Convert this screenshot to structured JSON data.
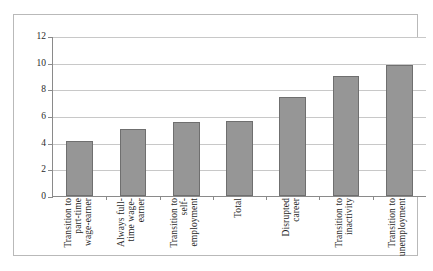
{
  "chart_data": {
    "type": "bar",
    "title": "",
    "xlabel": "",
    "ylabel": "",
    "ylim": [
      0,
      12
    ],
    "yticks": [
      0,
      2,
      4,
      6,
      8,
      10,
      12
    ],
    "ytick_labels": [
      "0",
      "2",
      "4",
      "6",
      "8",
      "10",
      "12"
    ],
    "grid": "horizontal",
    "legend": "none",
    "bar_color": "#969696",
    "bar_border_color": "#6f6f6f",
    "categories": [
      "Transition to part-time wage-earner",
      "Always full-time wage-earner",
      "Transition to self-employment",
      "Total",
      "Disrupted career",
      "Transition to inactivity",
      "Transition to unemployment"
    ],
    "category_lines": [
      [
        "Transition to",
        "part-time",
        "wage-earner"
      ],
      [
        "Always full-",
        "time wage-",
        "earner"
      ],
      [
        "Transition to",
        "self-",
        "employment"
      ],
      [
        "Total"
      ],
      [
        "Disrupted",
        "career"
      ],
      [
        "Transition to",
        "inactivity"
      ],
      [
        "Transition to",
        "unemployment"
      ]
    ],
    "values": [
      4.1,
      5.0,
      5.55,
      5.6,
      7.45,
      9.0,
      9.8
    ]
  }
}
